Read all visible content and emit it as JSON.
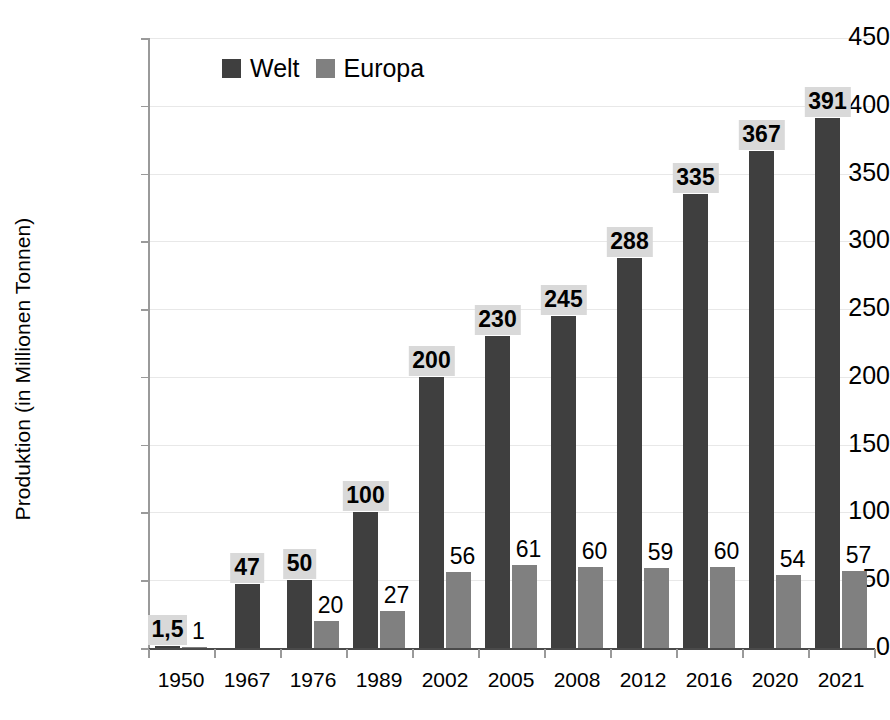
{
  "chart_data": {
    "type": "bar",
    "title": "",
    "xlabel": "",
    "ylabel": "Produktion (in Millionen Tonnen)",
    "ylim": [
      0,
      450
    ],
    "ytick_step": 50,
    "yticks": [
      450,
      400,
      350,
      300,
      250,
      200,
      150,
      100,
      50,
      0
    ],
    "grid": true,
    "legend_position": "top-left-inside",
    "categories": [
      "1950",
      "1967",
      "1976",
      "1989",
      "2002",
      "2005",
      "2008",
      "2012",
      "2016",
      "2020",
      "2021"
    ],
    "series": [
      {
        "name": "Welt",
        "color": "#3f3f3f",
        "values": [
          1.5,
          47,
          50,
          100,
          200,
          230,
          245,
          288,
          335,
          367,
          391
        ],
        "value_labels": [
          "1,5",
          "47",
          "50",
          "100",
          "200",
          "230",
          "245",
          "288",
          "335",
          "367",
          "391"
        ]
      },
      {
        "name": "Europa",
        "color": "#808080",
        "values": [
          1,
          null,
          20,
          27,
          56,
          61,
          60,
          59,
          60,
          54,
          57
        ],
        "value_labels": [
          "1",
          "",
          "20",
          "27",
          "56",
          "61",
          "60",
          "59",
          "60",
          "54",
          "57"
        ]
      }
    ]
  },
  "legend": {
    "items": [
      {
        "label": "Welt",
        "color": "#3f3f3f"
      },
      {
        "label": "Europa",
        "color": "#808080"
      }
    ]
  },
  "axes": {
    "y_title": "Produktion (in Millionen Tonnen)"
  },
  "colors": {
    "welt": "#3f3f3f",
    "europa": "#808080",
    "label_highlight": "#d9d9d9",
    "gridline": "#e8e8e8",
    "axis": "#9a9a9a",
    "background": "#ffffff"
  }
}
